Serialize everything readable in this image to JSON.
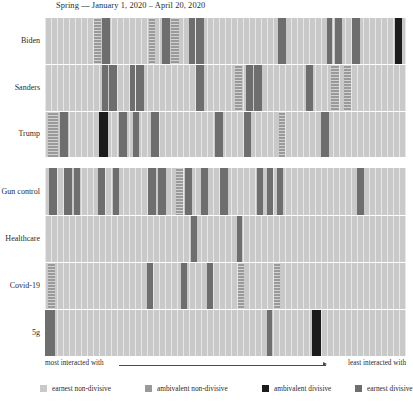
{
  "title": "Spring — January 1, 2020 – April 20, 2020",
  "axis": {
    "left_label": "most interacted with",
    "right_label": "least interacted with",
    "arrow_icon": "right-arrow-icon"
  },
  "legend": {
    "items": [
      {
        "label": "earnest non-divisive",
        "color": "#c9c9c9",
        "key": "earnest-nondiv"
      },
      {
        "label": "ambivalent non-divisive",
        "color": "#9a9a9a",
        "key": "amb-nondiv"
      },
      {
        "label": "ambivalent divisive",
        "color": "#1c1c1c",
        "key": "amb-div"
      },
      {
        "label": "earnest divisive",
        "color": "#6e6e6e",
        "key": "earnest-div"
      }
    ]
  },
  "panels": [
    {
      "name": "candidates",
      "rows": [
        {
          "label": "Biden"
        },
        {
          "label": "Sanders"
        },
        {
          "label": "Trump"
        }
      ]
    },
    {
      "name": "topics",
      "rows": [
        {
          "label": "Gun control"
        },
        {
          "label": "Healthcare"
        },
        {
          "label": "Covid-19"
        },
        {
          "label": "5g"
        }
      ]
    }
  ],
  "chart_data": {
    "type": "heatmap",
    "title": "Spring — January 1, 2020 – April 20, 2020",
    "xlabel": "most interacted with → least interacted with",
    "ylabel": "",
    "legend_position": "bottom",
    "grid": true,
    "categories": [
      "earnest non-divisive",
      "ambivalent non-divisive",
      "ambivalent divisive",
      "earnest divisive"
    ],
    "category_colors": [
      "#c9c9c9",
      "#9a9a9a",
      "#1c1c1c",
      "#6e6e6e"
    ],
    "x_range_percent": [
      0,
      100
    ],
    "note": "Each row is an ordered strip of posts sorted left (most interacted with) to right (least interacted with); segments below list non-default-class bands as percent offsets/widths of the strip.",
    "rows": [
      {
        "label": "Biden",
        "panel": "candidates",
        "segments": [
          {
            "start": 13.6,
            "width": 1.9,
            "class": "ambivalent non-divisive"
          },
          {
            "start": 15.8,
            "width": 2.2,
            "class": "earnest divisive"
          },
          {
            "start": 28.8,
            "width": 1.7,
            "class": "ambivalent non-divisive"
          },
          {
            "start": 32.4,
            "width": 2.2,
            "class": "earnest divisive"
          },
          {
            "start": 34.9,
            "width": 2.2,
            "class": "ambivalent non-divisive"
          },
          {
            "start": 39.9,
            "width": 1.7,
            "class": "earnest divisive"
          },
          {
            "start": 41.8,
            "width": 2.2,
            "class": "earnest divisive"
          },
          {
            "start": 64.5,
            "width": 2.2,
            "class": "earnest divisive"
          },
          {
            "start": 78.1,
            "width": 1.4,
            "class": "earnest divisive"
          },
          {
            "start": 80.3,
            "width": 1.9,
            "class": "earnest divisive"
          },
          {
            "start": 85.0,
            "width": 2.2,
            "class": "earnest divisive"
          },
          {
            "start": 96.9,
            "width": 1.9,
            "class": "ambivalent divisive"
          }
        ]
      },
      {
        "label": "Sanders",
        "panel": "candidates",
        "segments": [
          {
            "start": 15.8,
            "width": 1.7,
            "class": "earnest divisive"
          },
          {
            "start": 17.7,
            "width": 2.2,
            "class": "earnest divisive"
          },
          {
            "start": 23.5,
            "width": 1.4,
            "class": "earnest divisive"
          },
          {
            "start": 25.2,
            "width": 2.2,
            "class": "earnest divisive"
          },
          {
            "start": 41.8,
            "width": 2.2,
            "class": "earnest divisive"
          },
          {
            "start": 52.6,
            "width": 1.9,
            "class": "ambivalent non-divisive"
          },
          {
            "start": 55.7,
            "width": 1.9,
            "class": "earnest divisive"
          },
          {
            "start": 57.9,
            "width": 2.2,
            "class": "earnest divisive"
          },
          {
            "start": 72.3,
            "width": 1.9,
            "class": "earnest divisive"
          },
          {
            "start": 79.2,
            "width": 2.2,
            "class": "ambivalent non-divisive"
          },
          {
            "start": 82.8,
            "width": 1.9,
            "class": "ambivalent non-divisive"
          }
        ]
      },
      {
        "label": "Trump",
        "panel": "candidates",
        "segments": [
          {
            "start": 0.8,
            "width": 2.8,
            "class": "ambivalent non-divisive"
          },
          {
            "start": 4.2,
            "width": 2.2,
            "class": "earnest divisive"
          },
          {
            "start": 15.0,
            "width": 2.5,
            "class": "ambivalent divisive"
          },
          {
            "start": 20.5,
            "width": 2.2,
            "class": "earnest divisive"
          },
          {
            "start": 24.4,
            "width": 1.7,
            "class": "earnest divisive"
          },
          {
            "start": 29.4,
            "width": 2.2,
            "class": "earnest divisive"
          },
          {
            "start": 47.1,
            "width": 2.2,
            "class": "earnest divisive"
          },
          {
            "start": 55.1,
            "width": 1.9,
            "class": "earnest divisive"
          },
          {
            "start": 64.8,
            "width": 1.7,
            "class": "ambivalent non-divisive"
          },
          {
            "start": 76.5,
            "width": 2.2,
            "class": "earnest divisive"
          }
        ]
      },
      {
        "label": "Gun control",
        "panel": "topics",
        "segments": [
          {
            "start": 1.1,
            "width": 2.2,
            "class": "earnest divisive"
          },
          {
            "start": 5.3,
            "width": 2.2,
            "class": "earnest divisive"
          },
          {
            "start": 8.0,
            "width": 1.7,
            "class": "earnest divisive"
          },
          {
            "start": 14.7,
            "width": 1.9,
            "class": "earnest divisive"
          },
          {
            "start": 18.8,
            "width": 1.7,
            "class": "earnest divisive"
          },
          {
            "start": 28.5,
            "width": 2.2,
            "class": "earnest divisive"
          },
          {
            "start": 31.3,
            "width": 2.2,
            "class": "earnest divisive"
          },
          {
            "start": 36.3,
            "width": 1.9,
            "class": "ambivalent non-divisive"
          },
          {
            "start": 38.8,
            "width": 1.9,
            "class": "earnest divisive"
          },
          {
            "start": 43.2,
            "width": 1.9,
            "class": "earnest divisive"
          },
          {
            "start": 48.5,
            "width": 2.2,
            "class": "earnest divisive"
          },
          {
            "start": 58.7,
            "width": 1.7,
            "class": "earnest divisive"
          },
          {
            "start": 61.5,
            "width": 1.7,
            "class": "earnest divisive"
          },
          {
            "start": 64.3,
            "width": 1.7,
            "class": "earnest divisive"
          },
          {
            "start": 86.4,
            "width": 1.9,
            "class": "earnest divisive"
          }
        ]
      },
      {
        "label": "Healthcare",
        "panel": "topics",
        "segments": [
          {
            "start": 40.4,
            "width": 1.7,
            "class": "earnest divisive"
          },
          {
            "start": 53.2,
            "width": 1.4,
            "class": "earnest divisive"
          }
        ]
      },
      {
        "label": "Covid-19",
        "panel": "topics",
        "segments": [
          {
            "start": 0.8,
            "width": 1.9,
            "class": "ambivalent non-divisive"
          },
          {
            "start": 28.3,
            "width": 1.7,
            "class": "earnest divisive"
          },
          {
            "start": 37.7,
            "width": 1.7,
            "class": "earnest divisive"
          },
          {
            "start": 44.9,
            "width": 1.7,
            "class": "earnest divisive"
          },
          {
            "start": 53.5,
            "width": 1.7,
            "class": "ambivalent non-divisive"
          },
          {
            "start": 63.4,
            "width": 1.7,
            "class": "ambivalent non-divisive"
          }
        ]
      },
      {
        "label": "5g",
        "panel": "topics",
        "segments": [
          {
            "start": 0.0,
            "width": 2.8,
            "class": "earnest divisive"
          },
          {
            "start": 61.5,
            "width": 1.4,
            "class": "earnest divisive"
          },
          {
            "start": 74.0,
            "width": 2.5,
            "class": "ambivalent divisive"
          }
        ]
      }
    ]
  }
}
